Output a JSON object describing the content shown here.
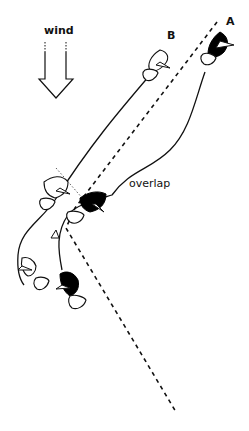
{
  "diagram": {
    "type": "sailing-rule-illustration",
    "labels": {
      "wind": "wind",
      "boat_a": "A",
      "boat_b": "B",
      "overlap": "overlap"
    },
    "colors": {
      "line": "#111111",
      "boat_a_hull": "#000000",
      "boat_b_hull": "#ffffff",
      "background": "#ffffff"
    },
    "elements": {
      "wind_arrow": {
        "direction": "down"
      },
      "mark": {
        "shape": "triangle"
      },
      "rhumb_line": {
        "style": "dashed"
      },
      "zone_line": {
        "style": "dotted"
      }
    }
  }
}
